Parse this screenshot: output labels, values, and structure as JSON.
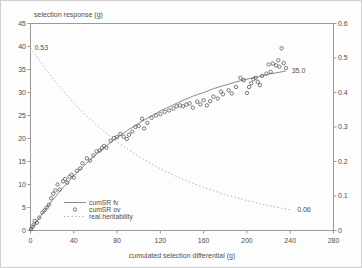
{
  "window": {
    "background": "#fdfdfd",
    "border_color": "#cfcfcf"
  },
  "colors": {
    "frame": "#9a9a9a",
    "text": "#4f4f4f",
    "fv_line": "#7d7d7d",
    "ov_marker": "#5a5a5a",
    "heritability_line": "#9f9f9f"
  },
  "chart_data": {
    "type": "scatter",
    "title": "",
    "ylabel": "selection response (g)",
    "xlabel": "cumulated selection differential (g)",
    "xlim": [
      0,
      280
    ],
    "ylim_left": [
      0,
      45
    ],
    "ylim_right": [
      0,
      0.6
    ],
    "grid": false,
    "x_ticks": [
      "0",
      "40",
      "80",
      "120",
      "160",
      "200",
      "240",
      "280"
    ],
    "y_left_ticks": [
      "0",
      "5",
      "10",
      "15",
      "20",
      "25",
      "30",
      "35",
      "40",
      "45"
    ],
    "y_right_ticks": [
      "0",
      "0.1",
      "0.2",
      "0.3",
      "0.4",
      "0.5",
      "0.6"
    ],
    "legend": {
      "position": "inside-bottom-left",
      "entries": [
        {
          "label": "cumSR fv",
          "marker": "solid-line"
        },
        {
          "label": "cumSR ov",
          "marker": "open-circle"
        },
        {
          "label": "real.heritability",
          "marker": "dashed-line"
        }
      ]
    },
    "annotations": [
      {
        "text": "0.53",
        "axis": "right",
        "x": 2.3,
        "value": 0.53
      },
      {
        "text": "35.0",
        "axis": "left",
        "x": 240,
        "value": 34.7
      },
      {
        "text": "0.06",
        "axis": "right",
        "x": 245,
        "value": 0.06
      }
    ],
    "series": [
      {
        "name": "cumSR fv",
        "type": "line",
        "style": "solid",
        "axis": "left",
        "color": "#7d7d7d",
        "points": [
          [
            0,
            0
          ],
          [
            10,
            3.4
          ],
          [
            20,
            6.5
          ],
          [
            30,
            9.3
          ],
          [
            40,
            11.9
          ],
          [
            50,
            14.2
          ],
          [
            60,
            16.4
          ],
          [
            70,
            18.4
          ],
          [
            80,
            20.2
          ],
          [
            90,
            21.8
          ],
          [
            100,
            23.3
          ],
          [
            110,
            24.7
          ],
          [
            120,
            26.0
          ],
          [
            130,
            27.1
          ],
          [
            140,
            28.2
          ],
          [
            150,
            29.2
          ],
          [
            160,
            30.0
          ],
          [
            170,
            30.9
          ],
          [
            180,
            31.6
          ],
          [
            190,
            32.3
          ],
          [
            200,
            32.9
          ],
          [
            210,
            33.4
          ],
          [
            220,
            34.0
          ],
          [
            230,
            34.4
          ],
          [
            236,
            34.7
          ]
        ]
      },
      {
        "name": "cumSR ov",
        "type": "scatter",
        "marker": "open-circle",
        "axis": "left",
        "color": "#5a5a5a",
        "points": [
          [
            0.5,
            0.3
          ],
          [
            2,
            0.8
          ],
          [
            3,
            1.3
          ],
          [
            4,
            2.1
          ],
          [
            6,
            1.7
          ],
          [
            8,
            2.8
          ],
          [
            11,
            3.9
          ],
          [
            13,
            4.4
          ],
          [
            15,
            5.0
          ],
          [
            17,
            5.6
          ],
          [
            19,
            7.0
          ],
          [
            21,
            8.0
          ],
          [
            23,
            8.7
          ],
          [
            25,
            10.0
          ],
          [
            27,
            8.9
          ],
          [
            30,
            10.7
          ],
          [
            32,
            11.2
          ],
          [
            34,
            10.4
          ],
          [
            36,
            11.7
          ],
          [
            38,
            12.1
          ],
          [
            40,
            11.5
          ],
          [
            43,
            13.0
          ],
          [
            46,
            13.5
          ],
          [
            48,
            14.6
          ],
          [
            52,
            15.7
          ],
          [
            55,
            15.2
          ],
          [
            58,
            16.3
          ],
          [
            61,
            17.2
          ],
          [
            64,
            17.4
          ],
          [
            66,
            17.9
          ],
          [
            68,
            18.4
          ],
          [
            70,
            18.0
          ],
          [
            74,
            19.5
          ],
          [
            77,
            20.1
          ],
          [
            80,
            20.3
          ],
          [
            83,
            21.0
          ],
          [
            86,
            20.4
          ],
          [
            89,
            19.9
          ],
          [
            91,
            20.8
          ],
          [
            94,
            21.5
          ],
          [
            97,
            22.5
          ],
          [
            100,
            22.7
          ],
          [
            103,
            24.3
          ],
          [
            105,
            22.2
          ],
          [
            108,
            23.4
          ],
          [
            112,
            24.5
          ],
          [
            116,
            25.0
          ],
          [
            120,
            25.3
          ],
          [
            124,
            25.8
          ],
          [
            128,
            26.1
          ],
          [
            132,
            26.5
          ],
          [
            135,
            27.0
          ],
          [
            138,
            27.2
          ],
          [
            141,
            27.0
          ],
          [
            144,
            27.4
          ],
          [
            147,
            27.6
          ],
          [
            150,
            26.7
          ],
          [
            154,
            28.0
          ],
          [
            157,
            27.4
          ],
          [
            160,
            28.3
          ],
          [
            163,
            27.2
          ],
          [
            166,
            28.1
          ],
          [
            169,
            29.1
          ],
          [
            173,
            28.7
          ],
          [
            176,
            30.2
          ],
          [
            178,
            29.6
          ],
          [
            183,
            30.5
          ],
          [
            186,
            29.8
          ],
          [
            190,
            31.2
          ],
          [
            194,
            33.2
          ],
          [
            197,
            32.7
          ],
          [
            200,
            29.9
          ],
          [
            202,
            31.2
          ],
          [
            204,
            32.0
          ],
          [
            206,
            32.9
          ],
          [
            208,
            33.2
          ],
          [
            210,
            32.3
          ],
          [
            212,
            31.6
          ],
          [
            214,
            33.6
          ],
          [
            218,
            34.1
          ],
          [
            220,
            36.1
          ],
          [
            222,
            34.5
          ],
          [
            224,
            36.3
          ],
          [
            227,
            35.9
          ],
          [
            229,
            37.0
          ],
          [
            230,
            35.6
          ],
          [
            232,
            39.6
          ],
          [
            234,
            36.4
          ],
          [
            236,
            35.3
          ]
        ]
      },
      {
        "name": "real.heritability",
        "type": "line",
        "style": "dashed",
        "axis": "right",
        "color": "#9f9f9f",
        "points": [
          [
            0,
            0.53
          ],
          [
            20,
            0.442
          ],
          [
            40,
            0.369
          ],
          [
            60,
            0.308
          ],
          [
            80,
            0.257
          ],
          [
            100,
            0.214
          ],
          [
            120,
            0.179
          ],
          [
            140,
            0.149
          ],
          [
            160,
            0.125
          ],
          [
            180,
            0.104
          ],
          [
            200,
            0.087
          ],
          [
            220,
            0.072
          ],
          [
            240,
            0.06
          ]
        ]
      }
    ]
  }
}
